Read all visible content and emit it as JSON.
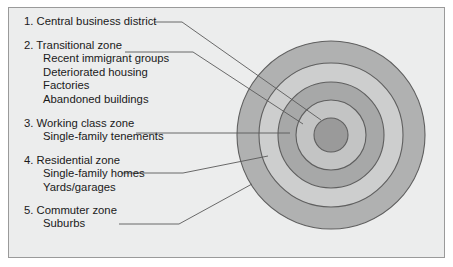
{
  "diagram": {
    "type": "concentric-zone-diagram",
    "background_color": "#eceded",
    "border_color": "#9a9a9a",
    "text_color": "#1a1a1a",
    "leader_line_color": "#5a5a5a",
    "ring_outline_color": "#5f5f5f",
    "center": {
      "x": 331,
      "y": 135
    },
    "zones": [
      {
        "number": "1.",
        "title": "1. Central business district",
        "items": [],
        "radius": 17,
        "fill": "#9a9a9a",
        "leader_end": {
          "x": 321,
          "y": 120
        }
      },
      {
        "number": "2.",
        "title": "2. Transitional zone",
        "items": [
          "Recent immigrant groups",
          "Deteriorated housing",
          "Factories",
          "Abandoned buildings"
        ],
        "radius": 35,
        "fill": "#c3c4c4",
        "leader_end": {
          "x": 303,
          "y": 124
        }
      },
      {
        "number": "3.",
        "title": "3. Working class zone",
        "items": [
          "Single-family tenements"
        ],
        "radius": 53,
        "fill": "#a7a8a8",
        "leader_end": {
          "x": 290,
          "y": 133
        }
      },
      {
        "number": "4.",
        "title": "4. Residential zone",
        "items": [
          "Single-family homes",
          "Yards/garages"
        ],
        "radius": 72,
        "fill": "#cdcece",
        "leader_end": {
          "x": 268,
          "y": 156
        }
      },
      {
        "number": "5.",
        "title": "5. Commuter zone",
        "items": [
          "Suburbs"
        ],
        "radius": 94,
        "fill": "#b0b1b1",
        "leader_end": {
          "x": 252,
          "y": 184
        }
      }
    ]
  }
}
